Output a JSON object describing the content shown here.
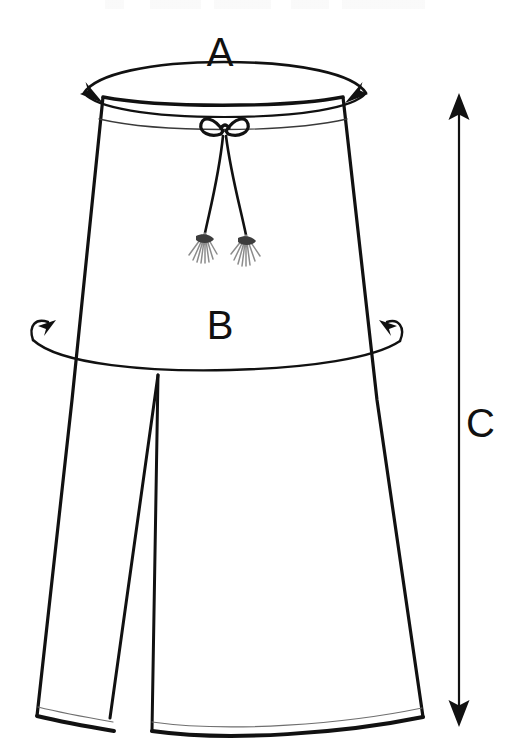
{
  "diagram": {
    "type": "garment-measurement-diagram",
    "background_color": "#ffffff",
    "stroke_color": "#111111",
    "tassel_color": "#8c8c8c",
    "labels": {
      "a": "A",
      "b": "B",
      "c": "C"
    },
    "measurements": [
      {
        "id": "a",
        "label": "A",
        "name": "waist",
        "marker": "horizontal-ellipse-double-arrow",
        "label_position": "above-waistband"
      },
      {
        "id": "b",
        "label": "B",
        "name": "hip",
        "marker": "horizontal-arc-double-arrow",
        "label_position": "above-hip-arc"
      },
      {
        "id": "c",
        "label": "C",
        "name": "length",
        "marker": "vertical-double-headed-arrow",
        "label_position": "right-of-arrow"
      }
    ],
    "parts": [
      "waistband",
      "waistband-seam",
      "drawstring-bow",
      "drawstring-cord-left",
      "drawstring-cord-right",
      "tassel-left",
      "tassel-right",
      "left-leg",
      "right-leg",
      "crotch-split",
      "left-hem",
      "right-hem"
    ]
  }
}
